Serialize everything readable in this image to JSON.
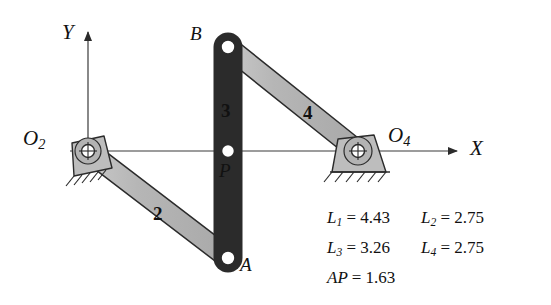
{
  "diagram": {
    "axes": {
      "x_label": "X",
      "y_label": "Y"
    },
    "ground_pivots": [
      {
        "name": "O2",
        "label_base": "O",
        "label_sub": "2"
      },
      {
        "name": "O4",
        "label_base": "O",
        "label_sub": "4"
      }
    ],
    "joint_labels": [
      {
        "name": "B",
        "label": "B"
      },
      {
        "name": "A",
        "label": "A"
      },
      {
        "name": "P",
        "label": "P"
      }
    ],
    "link_labels": [
      {
        "name": "link-2",
        "label": "2"
      },
      {
        "name": "link-3",
        "label": "3"
      },
      {
        "name": "link-4",
        "label": "4"
      }
    ],
    "colors": {
      "link_fill": "#b9b9b9",
      "link_stroke": "#2b2b2b",
      "joint_fill": "#ffffff",
      "axis": "#3a3a3a",
      "text": "#111111",
      "background": "#ffffff"
    }
  },
  "dimensions": {
    "rows": [
      [
        {
          "symbol_base": "L",
          "symbol_sub": "1",
          "eq": "=",
          "value": "4.43"
        },
        {
          "symbol_base": "L",
          "symbol_sub": "2",
          "eq": "=",
          "value": "2.75"
        }
      ],
      [
        {
          "symbol_base": "L",
          "symbol_sub": "3",
          "eq": "=",
          "value": "3.26"
        },
        {
          "symbol_base": "L",
          "symbol_sub": "4",
          "eq": "=",
          "value": "2.75"
        }
      ],
      [
        {
          "symbol_base": "AP",
          "symbol_sub": "",
          "eq": "=",
          "value": "1.63"
        }
      ]
    ]
  }
}
